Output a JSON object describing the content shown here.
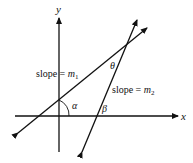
{
  "diagram": {
    "axes": {
      "x_label": "x",
      "y_label": "y"
    },
    "lines": [
      {
        "name": "line-1",
        "label_text": "slope = ",
        "label_var": "m",
        "label_sub": "1"
      },
      {
        "name": "line-2",
        "label_text": "slope = ",
        "label_var": "m",
        "label_sub": "2"
      }
    ],
    "angles": {
      "alpha": "α",
      "beta": "β",
      "theta": "θ"
    },
    "colors": {
      "stroke": "#111111",
      "background": "#ffffff"
    }
  }
}
